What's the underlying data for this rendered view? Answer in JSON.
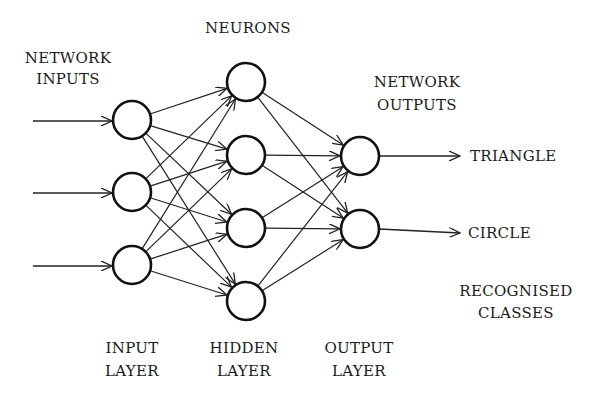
{
  "diagram": {
    "type": "neural-network",
    "labels": {
      "neurons": "NEURONS",
      "network_inputs": [
        "NETWORK",
        "INPUTS"
      ],
      "network_outputs": [
        "NETWORK",
        "OUTPUTS"
      ],
      "recognised_classes": [
        "RECOGNISED",
        "CLASSES"
      ],
      "input_layer": [
        "INPUT",
        "LAYER"
      ],
      "hidden_layer": [
        "HIDDEN",
        "LAYER"
      ],
      "output_layer": [
        "OUTPUT",
        "LAYER"
      ]
    },
    "classes": [
      "TRIANGLE",
      "CIRCLE"
    ],
    "layers": {
      "input": {
        "x": 132,
        "ys": [
          120,
          192,
          265
        ]
      },
      "hidden": {
        "x": 246,
        "ys": [
          82,
          155,
          228,
          301
        ]
      },
      "output": {
        "x": 360,
        "ys": [
          156,
          229
        ]
      }
    },
    "node_radius": 19,
    "colors": {
      "stroke": "#111111",
      "background": "#ffffff",
      "text": "#1a1a1a"
    }
  }
}
